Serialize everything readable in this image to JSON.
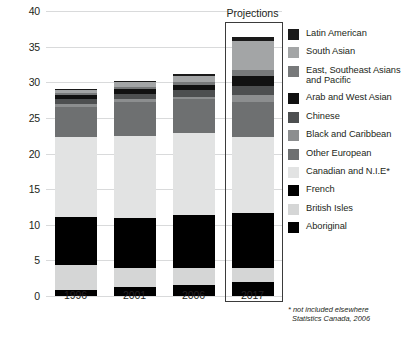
{
  "chart_data": {
    "type": "bar",
    "stacked": true,
    "title": "",
    "xlabel": "",
    "ylabel": "",
    "categories": [
      "1996",
      "2001",
      "2006",
      "2017"
    ],
    "ylim": [
      0,
      40
    ],
    "yticks": [
      0,
      5,
      10,
      15,
      20,
      25,
      30,
      35,
      40
    ],
    "grid": true,
    "legend_position": "right",
    "totals": [
      29.1,
      30.2,
      31.2,
      36.3
    ],
    "series": [
      {
        "name": "Aboriginal",
        "color": "#000000",
        "values": [
          0.8,
          1.2,
          1.6,
          1.9
        ]
      },
      {
        "name": "British Isles",
        "color": "#d5d6d6",
        "values": [
          3.5,
          2.8,
          2.4,
          2.1
        ]
      },
      {
        "name": "French",
        "color": "#000000",
        "values": [
          6.8,
          6.9,
          7.4,
          7.6
        ]
      },
      {
        "name": "Canadian and N.I.E*",
        "color": "#e2e3e3",
        "values": [
          11.2,
          11.6,
          11.5,
          10.7
        ]
      },
      {
        "name": "Other European",
        "color": "#6e7071",
        "values": [
          4.3,
          4.7,
          4.7,
          5.0
        ]
      },
      {
        "name": "Black and Caribbean",
        "color": "#8c8e8f",
        "values": [
          0.4,
          0.4,
          0.4,
          0.9
        ]
      },
      {
        "name": "Chinese",
        "color": "#4d4f50",
        "values": [
          0.7,
          0.8,
          0.9,
          1.3
        ]
      },
      {
        "name": "Arab and West Asian",
        "color": "#111111",
        "values": [
          0.5,
          0.6,
          0.7,
          1.4
        ]
      },
      {
        "name": "East, Southeast Asians and Pacific",
        "color": "#77797a",
        "values": [
          0.3,
          0.4,
          0.4,
          0.8
        ]
      },
      {
        "name": "South Asian",
        "color": "#a3a5a6",
        "values": [
          0.4,
          0.6,
          0.9,
          4.1
        ]
      },
      {
        "name": "Latin American",
        "color": "#1a1a1a",
        "values": [
          0.2,
          0.2,
          0.3,
          0.5
        ]
      }
    ]
  },
  "legend": {
    "items": [
      {
        "label": "Latin American",
        "color": "#1a1a1a"
      },
      {
        "label": "South Asian",
        "color": "#a3a5a6"
      },
      {
        "label": "East, Southeast Asians and Pacific",
        "color": "#77797a"
      },
      {
        "label": "Arab and West Asian",
        "color": "#111111"
      },
      {
        "label": "Chinese",
        "color": "#4d4f50"
      },
      {
        "label": "Black and Caribbean",
        "color": "#8c8e8f"
      },
      {
        "label": "Other European",
        "color": "#6e7071"
      },
      {
        "label": "Canadian and N.I.E*",
        "color": "#e2e3e3"
      },
      {
        "label": "French",
        "color": "#000000"
      },
      {
        "label": "British Isles",
        "color": "#d5d6d6"
      },
      {
        "label": "Aboriginal",
        "color": "#000000"
      }
    ]
  },
  "annotations": {
    "projections_label": "Projections",
    "projections_category": "2017"
  },
  "footnote": {
    "line1": "* not included elsewhere",
    "line2": "Statistics Canada, 2006"
  }
}
